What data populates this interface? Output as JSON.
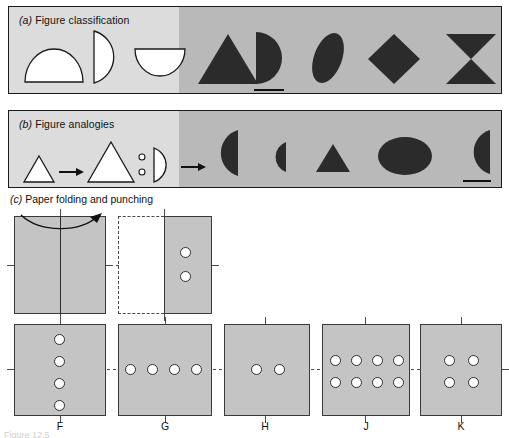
{
  "figure": {
    "bottom_caption": "Figure 12.5"
  },
  "panels": [
    {
      "id": "a",
      "letter": "(a)",
      "title": "Figure classification",
      "prompt_shapes": [
        "half-disc-up",
        "half-disc-right",
        "half-disc-down"
      ],
      "answer_shapes": [
        "triangle",
        "half-disc-right",
        "ellipse-tilted",
        "diamond",
        "bowtie"
      ],
      "marked_answer_index": 1
    },
    {
      "id": "b",
      "letter": "(b)",
      "title": "Figure analogies",
      "prompt_shapes": [
        "small-triangle",
        "arrow",
        "large-triangle",
        "colon",
        "half-disc-right",
        "arrow"
      ],
      "answer_shapes": [
        "half-disc-left",
        "half-disc-small-left",
        "triangle",
        "ellipse",
        "half-disc-left"
      ],
      "marked_answer_index": 4
    }
  ],
  "section_c": {
    "letter": "(c)",
    "title": "Paper folding and punching",
    "stimulus": {
      "step1": {
        "name": "unfolded-sheet",
        "fold_arrow": "fold-right-arrow",
        "fold_line": "vertical-center"
      },
      "step2": {
        "name": "folded-sheet-punched",
        "holes": 2,
        "hole_positions": [
          [
            0.55,
            0.38
          ],
          [
            0.55,
            0.62
          ]
        ]
      }
    },
    "options": [
      {
        "letter": "F",
        "holes": 4,
        "layout": "vertical-column"
      },
      {
        "letter": "G",
        "holes": 4,
        "layout": "horizontal-row"
      },
      {
        "letter": "H",
        "holes": 2,
        "layout": "horizontal-pair"
      },
      {
        "letter": "J",
        "holes": 8,
        "layout": "grid-4x2"
      },
      {
        "letter": "K",
        "holes": 4,
        "layout": "grid-2x2"
      }
    ]
  },
  "colors": {
    "panel_bg_light": "#dcdcdc",
    "panel_bg_dark": "#b9b9b9",
    "shape_fill_dark": "#2b2b2b",
    "shape_fill_light": "#ffffff",
    "sheet_fill": "#c4c4c4",
    "outline": "#1a1a1a"
  }
}
